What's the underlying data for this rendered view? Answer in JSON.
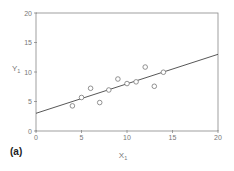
{
  "chart_data": {
    "type": "scatter",
    "title": "",
    "panel_label": "(a)",
    "xlabel": "X",
    "xlabel_sub": "1",
    "ylabel": "Y",
    "ylabel_sub": "1",
    "xlim": [
      0,
      20
    ],
    "ylim": [
      0,
      20
    ],
    "xticks": [
      0,
      5,
      10,
      15,
      20
    ],
    "yticks": [
      0,
      5,
      10,
      15,
      20
    ],
    "grid": false,
    "legend": null,
    "series": [
      {
        "name": "data",
        "marker": "open-circle",
        "x": [
          4,
          5,
          6,
          7,
          8,
          9,
          10,
          11,
          12,
          13,
          14
        ],
        "y": [
          4.26,
          5.68,
          7.24,
          4.82,
          6.95,
          8.81,
          8.04,
          8.33,
          10.84,
          7.58,
          9.96
        ]
      },
      {
        "name": "regression line",
        "type": "line",
        "x": [
          0,
          20
        ],
        "y": [
          3,
          13
        ]
      }
    ]
  },
  "colors": {
    "axis": "#888888",
    "marker": "#777777",
    "line": "#444444"
  }
}
